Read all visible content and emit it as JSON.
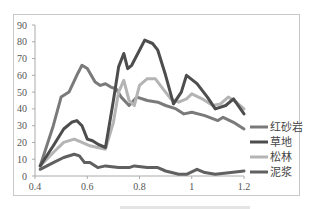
{
  "chart_data": {
    "type": "line",
    "title": "",
    "xlabel": "",
    "ylabel": "",
    "xlim": [
      0.4,
      1.2
    ],
    "ylim": [
      0,
      90
    ],
    "x_ticks": [
      "0.4",
      "0.6",
      "0.8",
      "1",
      "1.2"
    ],
    "y_ticks": [
      "0",
      "10",
      "20",
      "30",
      "40",
      "50",
      "60",
      "70",
      "80",
      "90"
    ],
    "grid": false,
    "legend_position": "right",
    "series": [
      {
        "name": "红砂岩",
        "color": "#7a7a7a",
        "points": [
          [
            0.42,
            6
          ],
          [
            0.47,
            30
          ],
          [
            0.5,
            47
          ],
          [
            0.53,
            50
          ],
          [
            0.56,
            60
          ],
          [
            0.58,
            66
          ],
          [
            0.6,
            64
          ],
          [
            0.63,
            56
          ],
          [
            0.65,
            54
          ],
          [
            0.67,
            55
          ],
          [
            0.69,
            53
          ],
          [
            0.71,
            52
          ],
          [
            0.73,
            47
          ],
          [
            0.76,
            42
          ],
          [
            0.79,
            47
          ],
          [
            0.83,
            45
          ],
          [
            0.87,
            44
          ],
          [
            0.9,
            42
          ],
          [
            0.94,
            40
          ],
          [
            0.97,
            37
          ],
          [
            1.0,
            38
          ],
          [
            1.05,
            36
          ],
          [
            1.1,
            33
          ],
          [
            1.12,
            35
          ],
          [
            1.16,
            32
          ],
          [
            1.2,
            28
          ]
        ]
      },
      {
        "name": "草地",
        "color": "#4d4d4d",
        "points": [
          [
            0.42,
            6
          ],
          [
            0.47,
            18
          ],
          [
            0.51,
            28
          ],
          [
            0.54,
            32
          ],
          [
            0.56,
            33
          ],
          [
            0.58,
            30
          ],
          [
            0.6,
            22
          ],
          [
            0.62,
            21
          ],
          [
            0.64,
            19
          ],
          [
            0.67,
            17
          ],
          [
            0.7,
            45
          ],
          [
            0.72,
            65
          ],
          [
            0.74,
            73
          ],
          [
            0.755,
            64
          ],
          [
            0.77,
            66
          ],
          [
            0.8,
            75
          ],
          [
            0.82,
            81
          ],
          [
            0.85,
            79
          ],
          [
            0.87,
            75
          ],
          [
            0.9,
            60
          ],
          [
            0.93,
            43
          ],
          [
            0.96,
            50
          ],
          [
            0.98,
            60
          ],
          [
            1.02,
            55
          ],
          [
            1.06,
            47
          ],
          [
            1.09,
            40
          ],
          [
            1.13,
            42
          ],
          [
            1.16,
            46
          ],
          [
            1.2,
            37
          ]
        ]
      },
      {
        "name": "松林",
        "color": "#b4b4b4",
        "points": [
          [
            0.42,
            6
          ],
          [
            0.47,
            14
          ],
          [
            0.51,
            20
          ],
          [
            0.55,
            22
          ],
          [
            0.58,
            20
          ],
          [
            0.61,
            18
          ],
          [
            0.64,
            17
          ],
          [
            0.67,
            16
          ],
          [
            0.7,
            32
          ],
          [
            0.72,
            50
          ],
          [
            0.74,
            57
          ],
          [
            0.76,
            45
          ],
          [
            0.78,
            42
          ],
          [
            0.8,
            54
          ],
          [
            0.83,
            58
          ],
          [
            0.86,
            58
          ],
          [
            0.89,
            52
          ],
          [
            0.92,
            46
          ],
          [
            0.95,
            44
          ],
          [
            0.98,
            46
          ],
          [
            1.0,
            49
          ],
          [
            1.04,
            46
          ],
          [
            1.08,
            42
          ],
          [
            1.11,
            43
          ],
          [
            1.14,
            47
          ],
          [
            1.17,
            44
          ],
          [
            1.2,
            40
          ]
        ]
      },
      {
        "name": "泥浆",
        "color": "#606060",
        "points": [
          [
            0.42,
            4
          ],
          [
            0.47,
            8
          ],
          [
            0.51,
            11
          ],
          [
            0.55,
            13
          ],
          [
            0.57,
            12
          ],
          [
            0.59,
            8
          ],
          [
            0.61,
            8
          ],
          [
            0.64,
            5
          ],
          [
            0.67,
            6
          ],
          [
            0.72,
            5
          ],
          [
            0.76,
            5
          ],
          [
            0.78,
            6
          ],
          [
            0.83,
            5
          ],
          [
            0.87,
            5
          ],
          [
            0.9,
            3
          ],
          [
            0.95,
            1
          ],
          [
            0.98,
            1
          ],
          [
            1.02,
            4
          ],
          [
            1.05,
            2
          ],
          [
            1.09,
            1
          ],
          [
            1.15,
            2
          ],
          [
            1.2,
            3
          ]
        ]
      }
    ]
  },
  "legend": {
    "items": [
      "红砂岩",
      "草地",
      "松林",
      "泥浆"
    ]
  }
}
